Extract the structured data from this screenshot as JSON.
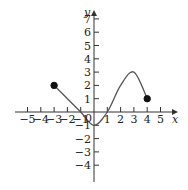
{
  "chart_data": {
    "type": "line",
    "title": "",
    "xlabel": "x",
    "ylabel": "y",
    "xlim": [
      -5,
      5
    ],
    "ylim": [
      -4,
      7
    ],
    "x_ticks": [
      -5,
      -4,
      -3,
      -2,
      -1,
      1,
      2,
      3,
      4,
      5
    ],
    "x_tick_labels": [
      "−5",
      "−4",
      "−3",
      "−2",
      "−1",
      "1",
      "2",
      "3",
      "4",
      "5"
    ],
    "y_ticks": [
      7,
      6,
      5,
      4,
      3,
      2,
      1,
      -1,
      -2,
      -3,
      -4
    ],
    "y_tick_labels": [
      "7",
      "6",
      "5",
      "4",
      "3",
      "2",
      "1",
      "−1",
      "−2",
      "−3",
      "−4"
    ],
    "origin_label": "0",
    "grid": false,
    "series": [
      {
        "name": "f(x)",
        "points": [
          {
            "x": -3,
            "y": 2
          },
          {
            "x": -2,
            "y": 1
          },
          {
            "x": -1,
            "y": 0
          },
          {
            "x": 0,
            "y": -1
          },
          {
            "x": 1,
            "y": 0
          },
          {
            "x": 2,
            "y": 2
          },
          {
            "x": 3,
            "y": 3
          },
          {
            "x": 4,
            "y": 1
          }
        ],
        "endpoints": [
          {
            "x": -3,
            "y": 2,
            "style": "closed"
          },
          {
            "x": 4,
            "y": 1,
            "style": "closed"
          }
        ]
      }
    ],
    "colors": {
      "axis": "#333333",
      "curve": "#555555",
      "dot": "#111111"
    }
  }
}
